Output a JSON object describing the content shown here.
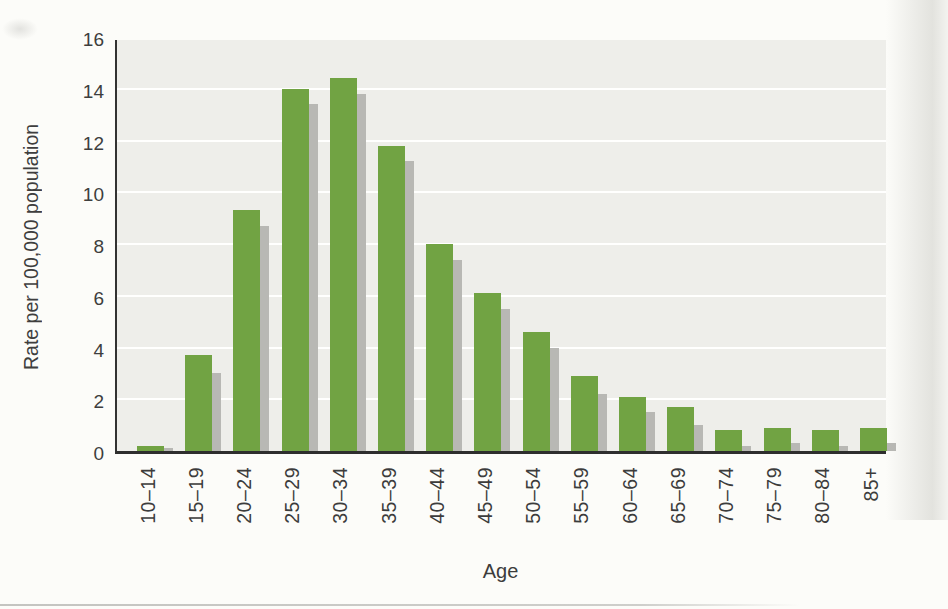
{
  "colors": {
    "bar_green": "#71a343",
    "bar_shadow_gray": "#b8b8b4",
    "plot_background": "#eeeeea",
    "page_background": "#fcfcf9",
    "gridline": "#ffffff",
    "axis_line": "#2e2e2e",
    "text": "#3e3e3e"
  },
  "chart_data": {
    "type": "bar",
    "title": "",
    "xlabel": "Age",
    "ylabel": "Rate per 100,000 population",
    "categories": [
      "10–14",
      "15–19",
      "20–24",
      "25–29",
      "30–34",
      "35–39",
      "40–44",
      "45–49",
      "50–54",
      "55–59",
      "60–64",
      "65–69",
      "70–74",
      "75–79",
      "80–84",
      "85+"
    ],
    "values": [
      0.2,
      3.7,
      9.3,
      14.0,
      14.4,
      11.8,
      8.0,
      6.1,
      4.6,
      2.9,
      2.1,
      1.7,
      0.8,
      0.9,
      0.8,
      0.9
    ],
    "shadow_values": [
      0.1,
      3.0,
      8.7,
      13.4,
      13.8,
      11.2,
      7.4,
      5.5,
      4.0,
      2.2,
      1.5,
      1.0,
      0.2,
      0.3,
      0.2,
      0.3
    ],
    "ylim": [
      0,
      16
    ],
    "yticks": [
      0,
      2,
      4,
      6,
      8,
      10,
      12,
      14,
      16
    ],
    "grid": true,
    "legend": "none",
    "bar_style": "green bars with gray drop shadow offset right and down"
  }
}
